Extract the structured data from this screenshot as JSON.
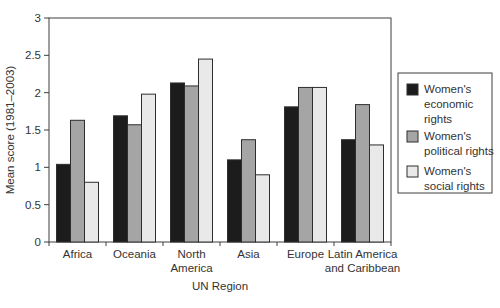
{
  "chart_data": {
    "type": "bar",
    "title": "",
    "xlabel": "UN Region",
    "ylabel": "Mean score (1981–2003)",
    "ylim": [
      0,
      3
    ],
    "yticks": [
      0,
      0.5,
      1,
      1.5,
      2,
      2.5,
      3
    ],
    "grid": false,
    "plot_border": true,
    "legend_position": "right-outside",
    "categories": [
      "Africa",
      "Oceania",
      "North America",
      "Asia",
      "Europe",
      "Latin America and Caribbean"
    ],
    "category_label_lines": [
      [
        "Africa"
      ],
      [
        "Oceania"
      ],
      [
        "North",
        "America"
      ],
      [
        "Asia"
      ],
      [
        "Europe"
      ],
      [
        "Latin America",
        "and Caribbean"
      ]
    ],
    "series": [
      {
        "name": "Women's economic rights",
        "key": "economic",
        "color": "#1c1c1c",
        "values": [
          1.04,
          1.69,
          2.13,
          1.1,
          1.81,
          1.37
        ]
      },
      {
        "name": "Women's political rights",
        "key": "political",
        "color": "#a5a5a5",
        "values": [
          1.63,
          1.57,
          2.09,
          1.37,
          2.07,
          1.84
        ]
      },
      {
        "name": "Women's social rights",
        "key": "social",
        "color": "#e9e9e9",
        "values": [
          0.8,
          1.98,
          2.45,
          0.9,
          2.07,
          1.3
        ]
      }
    ],
    "legend_entries": [
      {
        "key": "economic",
        "color": "#1c1c1c",
        "label": "Women's economic rights",
        "label_lines": [
          "Women's",
          "economic",
          "rights"
        ]
      },
      {
        "key": "political",
        "color": "#a5a5a5",
        "label": "Women's political rights",
        "label_lines": [
          "Women's",
          "political rights"
        ]
      },
      {
        "key": "social",
        "color": "#e9e9e9",
        "label": "Women's social rights",
        "label_lines": [
          "Women's",
          "social rights"
        ]
      }
    ]
  },
  "colors": {
    "axis": "#3f3f3f",
    "bar_outline": "#2e2e2e",
    "text": "#333333",
    "background": "#ffffff"
  }
}
